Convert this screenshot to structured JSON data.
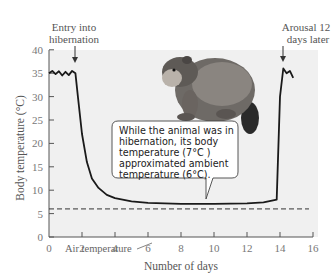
{
  "chart_data": {
    "type": "line",
    "title": "",
    "xlabel": "Number of days",
    "ylabel": "Body temperature (°C)",
    "xlim": [
      0,
      16
    ],
    "ylim": [
      0,
      40
    ],
    "xticks": [
      0,
      2,
      4,
      6,
      8,
      10,
      12,
      14,
      16
    ],
    "yticks": [
      0,
      5,
      10,
      15,
      20,
      25,
      30,
      35,
      40
    ],
    "grid": false,
    "series": [
      {
        "name": "Body temperature",
        "style": "solid",
        "x": [
          0,
          0.2,
          0.4,
          0.6,
          0.8,
          1.0,
          1.2,
          1.4,
          1.6,
          1.75,
          2.0,
          2.3,
          2.6,
          3.0,
          3.5,
          4.0,
          5.0,
          6.0,
          8.0,
          10.0,
          12.0,
          13.0,
          13.8,
          14.0,
          14.2,
          14.4,
          14.6,
          14.8
        ],
        "y": [
          35,
          35.5,
          34.8,
          35.4,
          34.5,
          35.3,
          34.6,
          35.5,
          35,
          30,
          22,
          16,
          12.5,
          10.5,
          9,
          8.3,
          7.6,
          7.3,
          7.1,
          7.1,
          7.2,
          7.4,
          8,
          30,
          36,
          35,
          35.5,
          34
        ]
      },
      {
        "name": "Air temperature",
        "style": "dashed",
        "x": [
          0,
          16
        ],
        "y": [
          6,
          6
        ]
      }
    ],
    "annotations": [
      {
        "text": "Entry into hibernation",
        "x": 1.6,
        "y": 35,
        "arrow": true
      },
      {
        "text": "Arousal 12 days later",
        "x": 14.0,
        "y": 36,
        "arrow": true
      },
      {
        "text": "While the animal was in hibernation, its body temperature (7°C ) approximated ambient temperature (6°C).",
        "type": "callout",
        "points_to": {
          "x": 9.5,
          "y": 7
        }
      },
      {
        "text": "Air temperature",
        "x": 2.5,
        "y": 3.5,
        "points_to": {
          "x": 4.2,
          "y": 6
        }
      }
    ],
    "legend": "none",
    "illustration": "marmot"
  },
  "labels": {
    "entry_line1": "Entry into",
    "entry_line2": "hibernation",
    "arousal_line1": "Arousal 12",
    "arousal_line2": "days later",
    "callout_lines": [
      "While the animal was in",
      "hibernation, its body",
      "temperature (7°C )",
      "approximated ambient",
      "temperature (6°C)."
    ],
    "air_temp": "Air temperature",
    "xlabel": "Number of days",
    "ylabel": "Body temperature (°C)"
  },
  "colors": {
    "plot_bg": "#f0f0f0",
    "line": "#1a1a1a",
    "axis": "#555555",
    "tick_text": "#666666",
    "label_text": "#555555"
  }
}
